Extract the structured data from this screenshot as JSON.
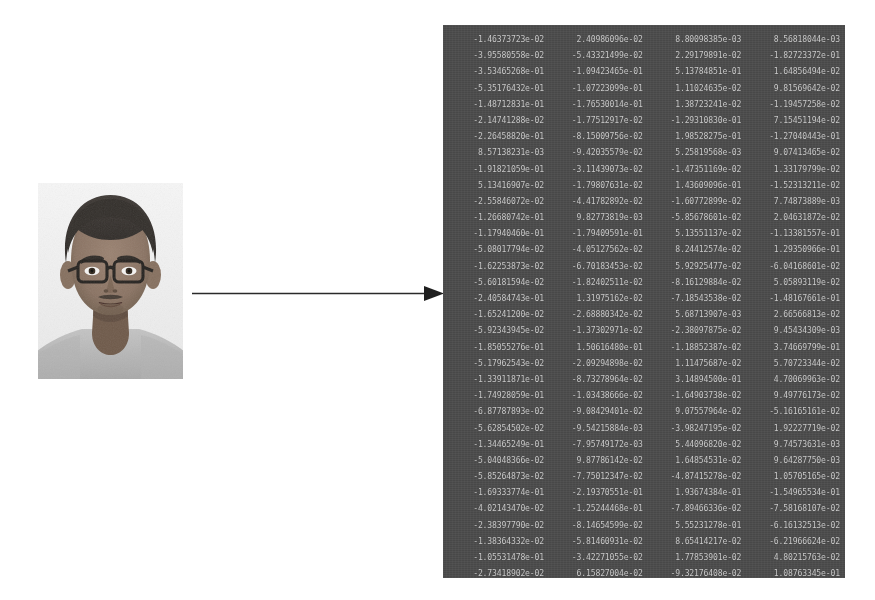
{
  "figure": {
    "title": "",
    "background_color": "#ffffff",
    "flow": "portrait photo -> feature embedding matrix"
  },
  "photo": {
    "alt_label": "passport-style portrait of a young person wearing eyeglasses",
    "background_color": "#f2f2f2",
    "skin_color": "#8c7566",
    "hair_color": "#3a3531",
    "shirt_color": "#b9b9b9",
    "glasses_color": "#2e2a27"
  },
  "arrow": {
    "direction": "right",
    "color": "#2a2a2a",
    "label": ""
  },
  "matrix": {
    "background_color": "#4e4e4e",
    "text_color": "#d8d8d8",
    "columns": 4,
    "rows": 34,
    "number_format": "scientific-notation",
    "values": [
      [
        "-1.46373723e-02",
        "2.40986096e-02",
        "8.80098385e-03",
        "8.56818044e-03"
      ],
      [
        "-3.95580558e-02",
        "-5.43321499e-02",
        "2.29179891e-02",
        "-1.82723372e-01"
      ],
      [
        "-3.53465268e-01",
        "-1.09423465e-01",
        "5.13784851e-01",
        "1.64856494e-02"
      ],
      [
        "-5.35176432e-01",
        "-1.07223099e-01",
        "1.11024635e-02",
        "9.81569642e-02"
      ],
      [
        "-1.48712831e-01",
        "-1.76530014e-01",
        "1.38723241e-02",
        "-1.19457258e-02"
      ],
      [
        "-2.14741288e-02",
        "-1.77512917e-02",
        "-1.29310830e-01",
        "7.15451194e-02"
      ],
      [
        "-2.26458820e-01",
        "-8.15009756e-02",
        "1.98528275e-01",
        "-1.27040443e-01"
      ],
      [
        "8.57138231e-03",
        "-9.42035579e-02",
        "5.25819568e-03",
        "9.07413465e-02"
      ],
      [
        "-1.91821059e-01",
        "-3.11439073e-02",
        "-1.47351169e-02",
        "1.33179799e-02"
      ],
      [
        "5.13416907e-02",
        "-1.79807631e-02",
        "1.43609096e-01",
        "-1.52313211e-02"
      ],
      [
        "-2.55846072e-02",
        "-4.41782892e-02",
        "-1.60772899e-02",
        "7.74873889e-03"
      ],
      [
        "-1.26680742e-01",
        "9.82773819e-03",
        "-5.85678601e-02",
        "2.04631872e-02"
      ],
      [
        "-1.17940460e-01",
        "-1.79409591e-01",
        "5.13551137e-02",
        "-1.13381557e-01"
      ],
      [
        "-5.08017794e-02",
        "-4.05127562e-02",
        "8.24412574e-02",
        "1.29350966e-01"
      ],
      [
        "-1.62253873e-02",
        "-6.70183453e-02",
        "5.92925477e-02",
        "-6.04168601e-02"
      ],
      [
        "-5.60181594e-02",
        "-1.82402511e-02",
        "-8.16129884e-02",
        "5.05893119e-02"
      ],
      [
        "-2.40584743e-01",
        "1.31975162e-02",
        "-7.18543538e-02",
        "-1.48167661e-01"
      ],
      [
        "-1.65241200e-02",
        "-2.68880342e-02",
        "5.68713907e-03",
        "2.66566813e-02"
      ],
      [
        "-5.92343945e-02",
        "-1.37302971e-02",
        "-2.38097875e-02",
        "9.45434309e-03"
      ],
      [
        "-1.85055276e-01",
        "1.50616480e-01",
        "-1.18852387e-02",
        "3.74669799e-01"
      ],
      [
        "-5.17962543e-02",
        "-2.09294898e-02",
        "1.11475687e-02",
        "5.70723344e-02"
      ],
      [
        "-1.33911871e-01",
        "-8.73278964e-02",
        "3.14894500e-01",
        "4.70069963e-02"
      ],
      [
        "-1.74928059e-01",
        "-1.03438666e-02",
        "-1.64903738e-02",
        "9.49776173e-02"
      ],
      [
        "-6.87787893e-02",
        "-9.08429401e-02",
        "9.07557964e-02",
        "-5.16165161e-02"
      ],
      [
        "-5.62854502e-02",
        "-9.54215884e-03",
        "-3.98247195e-02",
        "1.92227719e-02"
      ],
      [
        "-1.34465249e-01",
        "-7.95749172e-03",
        "5.44096820e-02",
        "9.74573631e-03"
      ],
      [
        "-5.04048366e-02",
        "9.87786142e-02",
        "1.64854531e-02",
        "9.64287750e-03"
      ],
      [
        "-5.85264873e-02",
        "-7.75012347e-02",
        "-4.87415278e-02",
        "1.05705165e-02"
      ],
      [
        "-1.69333774e-01",
        "-2.19370551e-01",
        "1.93674384e-01",
        "-1.54965534e-01"
      ],
      [
        "-4.02143470e-02",
        "-1.25244468e-01",
        "-7.89466336e-02",
        "-7.58168107e-02"
      ],
      [
        "-2.38397790e-02",
        "-8.14654599e-02",
        "5.55231278e-01",
        "-6.16132513e-02"
      ],
      [
        "-1.38364332e-02",
        "-5.81460931e-02",
        "8.65414217e-02",
        "-6.21966624e-02"
      ],
      [
        "-1.05531478e-01",
        "-3.42271055e-02",
        "1.77853901e-02",
        "4.80215763e-02"
      ],
      [
        "-2.73418902e-02",
        "6.15827004e-02",
        "-9.32176408e-02",
        "1.08763345e-01"
      ]
    ]
  }
}
